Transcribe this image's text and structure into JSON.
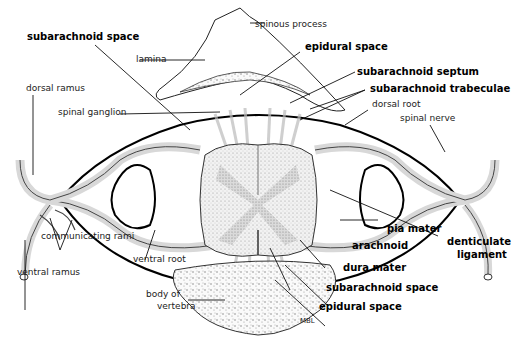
{
  "figure": {
    "credit": "MBL",
    "colors": {
      "ink": "#111111",
      "stipple": "#8a8a8a",
      "background": "#ffffff",
      "bone": "#f4f4f4"
    }
  },
  "labels": {
    "spinous_process": "spinous process",
    "lamina": "lamina",
    "subarachnoid_space_top": "subarachnoid space",
    "epidural_space_top": "epidural space",
    "subarachnoid_septum": "subarachnoid septum",
    "subarachnoid_trabeculae": "subarachnoid trabeculae",
    "dorsal_root": "dorsal root",
    "spinal_nerve": "spinal nerve",
    "dorsal_ramus": "dorsal ramus",
    "spinal_ganglion": "spinal ganglion",
    "communicating_rami": "communicating rami",
    "ventral_ramus": "ventral ramus",
    "ventral_root": "ventral root",
    "pia_mater": "pia mater",
    "denticulate_ligament_1": "denticulate",
    "denticulate_ligament_2": "ligament",
    "arachnoid": "arachnoid",
    "dura_mater": "dura mater",
    "subarachnoid_space_bottom": "subarachnoid space",
    "epidural_space_bottom": "epidural space",
    "body_of_vertebra_1": "body of",
    "body_of_vertebra_2": "vertebra",
    "credit": "MBL"
  }
}
